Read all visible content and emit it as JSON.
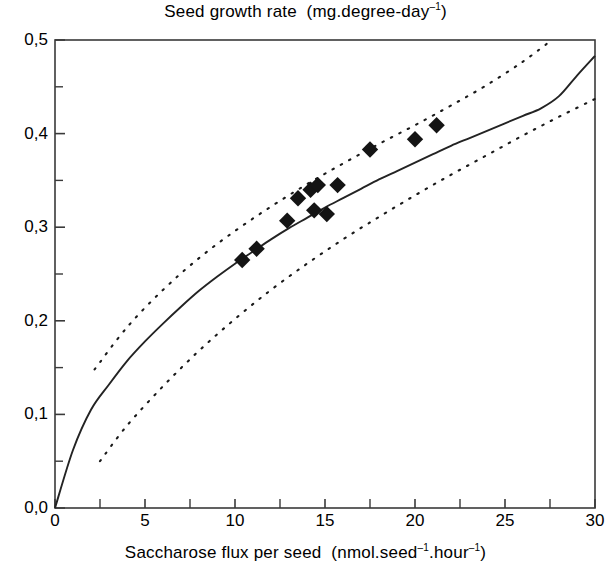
{
  "chart_data": {
    "type": "scatter",
    "title_main": "Seed growth rate",
    "title_units": "(mg.degree-day",
    "title_units_sup": "–1",
    "title_units_close": ")",
    "xlabel": "Saccharose flux per seed (nmol.seed⁻¹.hour⁻¹)",
    "xlabel_main": "Saccharose flux per seed",
    "xlabel_units_a": "(nmol.seed",
    "xlabel_units_sup1": "–1",
    "xlabel_units_b": ".hour",
    "xlabel_units_sup2": "–1",
    "xlabel_units_close": ")",
    "ylabel": "Seed growth rate (mg.degree-day⁻¹)",
    "xlim": [
      0,
      30
    ],
    "ylim": [
      0.0,
      0.5
    ],
    "grid": false,
    "legend": "none",
    "x_ticks": [
      0,
      5,
      10,
      15,
      20,
      25,
      30
    ],
    "x_tick_labels": [
      "0",
      "5",
      "10",
      "15",
      "20",
      "25",
      "30"
    ],
    "x_minor_ticks": [
      2.5,
      7.5,
      12.5,
      17.5,
      22.5,
      27.5
    ],
    "y_ticks": [
      0.0,
      0.1,
      0.2,
      0.3,
      0.4,
      0.5
    ],
    "y_tick_labels": [
      "0,0",
      "0,1",
      "0,2",
      "0,3",
      "0,4",
      "0,5"
    ],
    "y_minor_ticks": [
      0.05,
      0.15,
      0.25,
      0.35,
      0.45
    ],
    "decimal_separator": ",",
    "series": [
      {
        "name": "Observed seeds",
        "type": "scatter",
        "marker": "filled-diamond",
        "color": "#141414",
        "points": [
          {
            "x": 10.4,
            "y": 0.265
          },
          {
            "x": 11.2,
            "y": 0.277
          },
          {
            "x": 12.9,
            "y": 0.307
          },
          {
            "x": 13.5,
            "y": 0.331
          },
          {
            "x": 14.2,
            "y": 0.34
          },
          {
            "x": 14.6,
            "y": 0.345
          },
          {
            "x": 14.4,
            "y": 0.318
          },
          {
            "x": 15.1,
            "y": 0.314
          },
          {
            "x": 15.7,
            "y": 0.345
          },
          {
            "x": 17.5,
            "y": 0.383
          },
          {
            "x": 20.0,
            "y": 0.394
          },
          {
            "x": 21.2,
            "y": 0.409
          }
        ]
      },
      {
        "name": "Fitted curve",
        "type": "line",
        "style": "solid",
        "color": "#232323",
        "model": "square-root saturating fit",
        "x_range": [
          0,
          30
        ],
        "points": [
          {
            "x": 0.0,
            "y": 0.0
          },
          {
            "x": 1.0,
            "y": 0.062
          },
          {
            "x": 2.0,
            "y": 0.105
          },
          {
            "x": 3.0,
            "y": 0.132
          },
          {
            "x": 4.0,
            "y": 0.157
          },
          {
            "x": 5.0,
            "y": 0.178
          },
          {
            "x": 6.0,
            "y": 0.197
          },
          {
            "x": 7.0,
            "y": 0.215
          },
          {
            "x": 8.0,
            "y": 0.232
          },
          {
            "x": 9.0,
            "y": 0.247
          },
          {
            "x": 10.0,
            "y": 0.261
          },
          {
            "x": 11.0,
            "y": 0.274
          },
          {
            "x": 12.0,
            "y": 0.287
          },
          {
            "x": 13.0,
            "y": 0.299
          },
          {
            "x": 14.0,
            "y": 0.31
          },
          {
            "x": 15.0,
            "y": 0.321
          },
          {
            "x": 16.0,
            "y": 0.331
          },
          {
            "x": 17.0,
            "y": 0.341
          },
          {
            "x": 18.0,
            "y": 0.351
          },
          {
            "x": 19.0,
            "y": 0.36
          },
          {
            "x": 20.0,
            "y": 0.369
          },
          {
            "x": 21.0,
            "y": 0.378
          },
          {
            "x": 22.0,
            "y": 0.387
          },
          {
            "x": 23.0,
            "y": 0.395
          },
          {
            "x": 24.0,
            "y": 0.403
          },
          {
            "x": 25.0,
            "y": 0.411
          },
          {
            "x": 26.0,
            "y": 0.419
          },
          {
            "x": 27.0,
            "y": 0.427
          },
          {
            "x": 28.0,
            "y": 0.44
          },
          {
            "x": 29.0,
            "y": 0.462
          },
          {
            "x": 30.0,
            "y": 0.483
          }
        ]
      },
      {
        "name": "Upper confidence limit",
        "type": "line",
        "style": "dotted",
        "color": "#1a1a1a",
        "x_range": [
          2.2,
          27.6
        ],
        "points": [
          {
            "x": 2.2,
            "y": 0.148
          },
          {
            "x": 4.0,
            "y": 0.193
          },
          {
            "x": 6.0,
            "y": 0.233
          },
          {
            "x": 8.0,
            "y": 0.267
          },
          {
            "x": 10.0,
            "y": 0.296
          },
          {
            "x": 12.0,
            "y": 0.322
          },
          {
            "x": 14.0,
            "y": 0.346
          },
          {
            "x": 16.0,
            "y": 0.368
          },
          {
            "x": 18.0,
            "y": 0.389
          },
          {
            "x": 20.0,
            "y": 0.409
          },
          {
            "x": 22.0,
            "y": 0.43
          },
          {
            "x": 24.0,
            "y": 0.452
          },
          {
            "x": 26.0,
            "y": 0.477
          },
          {
            "x": 27.6,
            "y": 0.5
          }
        ]
      },
      {
        "name": "Lower confidence limit",
        "type": "line",
        "style": "dotted",
        "color": "#1a1a1a",
        "x_range": [
          2.5,
          30.0
        ],
        "points": [
          {
            "x": 2.5,
            "y": 0.05
          },
          {
            "x": 4.0,
            "y": 0.088
          },
          {
            "x": 6.0,
            "y": 0.13
          },
          {
            "x": 8.0,
            "y": 0.168
          },
          {
            "x": 10.0,
            "y": 0.202
          },
          {
            "x": 12.0,
            "y": 0.233
          },
          {
            "x": 14.0,
            "y": 0.261
          },
          {
            "x": 16.0,
            "y": 0.287
          },
          {
            "x": 18.0,
            "y": 0.311
          },
          {
            "x": 20.0,
            "y": 0.334
          },
          {
            "x": 22.0,
            "y": 0.356
          },
          {
            "x": 24.0,
            "y": 0.377
          },
          {
            "x": 26.0,
            "y": 0.398
          },
          {
            "x": 28.0,
            "y": 0.418
          },
          {
            "x": 30.0,
            "y": 0.437
          }
        ]
      }
    ],
    "axis_color": "#3a3a3a",
    "background": "#ffffff"
  }
}
